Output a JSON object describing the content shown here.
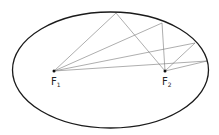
{
  "diagram": {
    "ellipse": {
      "cx": 110.5,
      "cy": 70,
      "rx": 98,
      "ry": 58,
      "stroke": "#1a1a1a"
    },
    "foci": [
      {
        "name": "F",
        "sub": "1",
        "x": 54,
        "y": 71
      },
      {
        "name": "F",
        "sub": "2",
        "x": 165,
        "y": 71
      }
    ],
    "reflection_points": [
      {
        "x": 116,
        "y": 13
      },
      {
        "x": 162,
        "y": 23
      },
      {
        "x": 195,
        "y": 43
      },
      {
        "x": 207,
        "y": 61
      }
    ],
    "ray_color": "#666666"
  }
}
